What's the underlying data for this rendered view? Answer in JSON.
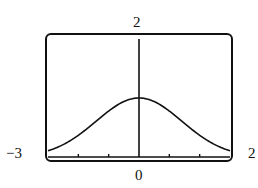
{
  "chart_data": {
    "type": "line",
    "title": "",
    "function": "exp(-x^2/4)",
    "xlim": [
      -3,
      3
    ],
    "ylim": [
      0,
      2
    ],
    "x_tick_step": 1,
    "labels": {
      "y_max": "2",
      "x_min": "−3",
      "x_max": "2",
      "x_origin": "0"
    },
    "series": [
      {
        "name": "curve",
        "x": [
          -3,
          -2.5,
          -2,
          -1.5,
          -1,
          -0.5,
          0,
          0.5,
          1,
          1.5,
          2,
          2.5,
          3
        ],
        "y": [
          0.105,
          0.21,
          0.37,
          0.57,
          0.78,
          0.94,
          1.0,
          0.94,
          0.78,
          0.57,
          0.37,
          0.21,
          0.105
        ]
      }
    ],
    "grid": false,
    "xlabel": "",
    "ylabel": ""
  }
}
